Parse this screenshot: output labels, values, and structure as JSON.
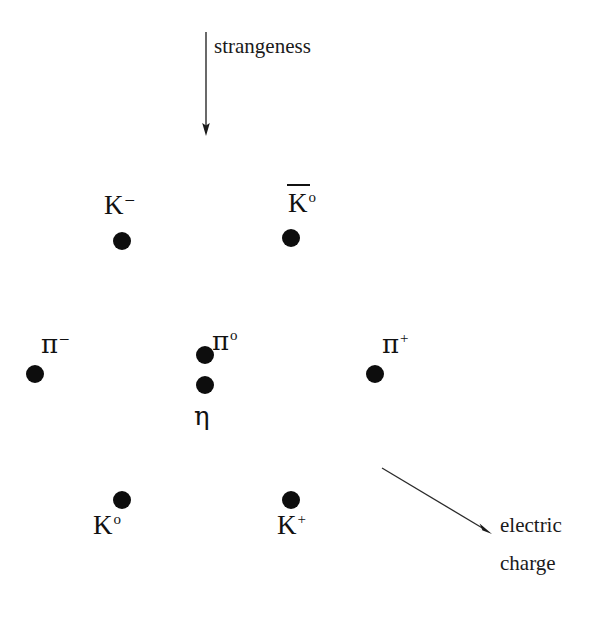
{
  "figure": {
    "name": "meson-octet-weight-diagram",
    "background_color": "#ffffff",
    "dot_color": "#0d0d0d",
    "line_color": "#1a1a1a"
  },
  "axes": {
    "vertical": {
      "label": "strangeness",
      "arrow_direction": "down",
      "arrow_from": [
        206,
        32
      ],
      "arrow_to": [
        206,
        135
      ],
      "label_position": [
        214,
        38
      ]
    },
    "diagonal": {
      "label_line1": "electric",
      "label_line2": "charge",
      "arrow_direction": "down-right",
      "arrow_from": [
        382,
        468
      ],
      "arrow_to": [
        491,
        534
      ],
      "label_position": [
        500,
        516
      ]
    }
  },
  "particles": [
    {
      "id": "k-minus",
      "base": "K",
      "superscript": "–",
      "overbar": false,
      "dot": [
        122,
        241
      ],
      "label_position": [
        104,
        192
      ],
      "row": "top",
      "strangeness": 1,
      "charge": -1
    },
    {
      "id": "k-zero-bar",
      "base": "K",
      "superscript": "o",
      "overbar": true,
      "dot": [
        291,
        238
      ],
      "label_position": [
        288,
        190
      ],
      "row": "top",
      "strangeness": 1,
      "charge": 0
    },
    {
      "id": "pi-minus",
      "base": "π",
      "superscript": "–",
      "overbar": false,
      "dot": [
        35,
        374
      ],
      "label_position": [
        41,
        331
      ],
      "row": "middle",
      "strangeness": 0,
      "charge": -1
    },
    {
      "id": "pi-zero",
      "base": "π",
      "superscript": "o",
      "overbar": false,
      "dot": [
        205,
        355
      ],
      "label_position": [
        212,
        328
      ],
      "row": "middle",
      "strangeness": 0,
      "charge": 0
    },
    {
      "id": "eta",
      "base": "η",
      "superscript": "",
      "overbar": false,
      "dot": [
        205,
        385
      ],
      "label_position": [
        194,
        403
      ],
      "row": "middle",
      "strangeness": 0,
      "charge": 0
    },
    {
      "id": "pi-plus",
      "base": "π",
      "superscript": "+",
      "overbar": false,
      "dot": [
        375,
        374
      ],
      "label_position": [
        382,
        331
      ],
      "row": "middle",
      "strangeness": 0,
      "charge": 1
    },
    {
      "id": "k-zero",
      "base": "K",
      "superscript": "o",
      "overbar": false,
      "dot": [
        122,
        500
      ],
      "label_position": [
        93,
        512
      ],
      "row": "bottom",
      "strangeness": -1,
      "charge": 0
    },
    {
      "id": "k-plus",
      "base": "K",
      "superscript": "+",
      "overbar": false,
      "dot": [
        291,
        500
      ],
      "label_position": [
        277,
        512
      ],
      "row": "bottom",
      "strangeness": -1,
      "charge": 1
    }
  ]
}
